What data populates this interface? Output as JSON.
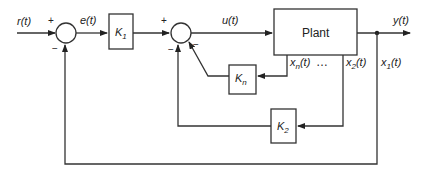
{
  "diagram": {
    "type": "block-diagram",
    "signals": {
      "reference": "r(t)",
      "error": "e(t)",
      "control": "u(t)",
      "output": "y(t)",
      "state_n": {
        "base": "x",
        "sub": "n",
        "arg": "(t)"
      },
      "state_2": {
        "base": "x",
        "sub": "2",
        "arg": "(t)"
      },
      "state_1": {
        "base": "x",
        "sub": "1",
        "arg": "(t)"
      },
      "ellipsis": "…"
    },
    "blocks": {
      "k1": {
        "base": "K",
        "sub": "1"
      },
      "kn": {
        "base": "K",
        "sub": "n"
      },
      "k2": {
        "base": "K",
        "sub": "2"
      },
      "plant": "Plant"
    },
    "junctions": {
      "sum1": {
        "plus": "+",
        "minus": "−"
      },
      "sum2": {
        "plus": "+",
        "minus_bottom": "−",
        "minus_diag": "−"
      }
    }
  }
}
